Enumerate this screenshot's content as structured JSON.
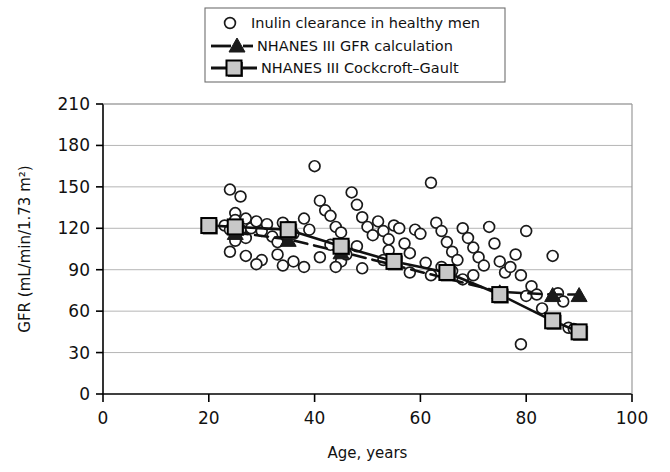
{
  "chart_data": {
    "type": "scatter",
    "title": "",
    "xlabel": "Age, years",
    "ylabel": "GFR  (mL/min/1.73 m²)",
    "xlim": [
      0,
      100
    ],
    "ylim": [
      0,
      210
    ],
    "xticks": [
      0,
      20,
      40,
      60,
      80,
      100
    ],
    "yticks": [
      0,
      30,
      60,
      90,
      120,
      150,
      180,
      210
    ],
    "grid": "horizontal",
    "legend_position": "top-center",
    "legend": [
      {
        "label": "Inulin clearance in healthy men",
        "marker": "open-circle",
        "line": "none"
      },
      {
        "label": "NHANES III GFR calculation",
        "marker": "filled-triangle",
        "line": "dashed"
      },
      {
        "label": "NHANES III Cockcroft–Gault",
        "marker": "filled-square",
        "line": "solid"
      }
    ],
    "series": [
      {
        "name": "Inulin clearance in healthy men",
        "marker": "open-circle",
        "points": [
          [
            24,
            148
          ],
          [
            26,
            143
          ],
          [
            25,
            131
          ],
          [
            25,
            126
          ],
          [
            27,
            127
          ],
          [
            23,
            122
          ],
          [
            24,
            119
          ],
          [
            26,
            119
          ],
          [
            28,
            120
          ],
          [
            29,
            125
          ],
          [
            27,
            113
          ],
          [
            25,
            111
          ],
          [
            24,
            103
          ],
          [
            27,
            100
          ],
          [
            30,
            118
          ],
          [
            31,
            123
          ],
          [
            32,
            114
          ],
          [
            33,
            110
          ],
          [
            34,
            124
          ],
          [
            35,
            121
          ],
          [
            36,
            116
          ],
          [
            33,
            101
          ],
          [
            30,
            97
          ],
          [
            36,
            96
          ],
          [
            38,
            127
          ],
          [
            39,
            119
          ],
          [
            40,
            165
          ],
          [
            41,
            140
          ],
          [
            42,
            133
          ],
          [
            43,
            129
          ],
          [
            44,
            121
          ],
          [
            45,
            117
          ],
          [
            43,
            108
          ],
          [
            41,
            99
          ],
          [
            45,
            96
          ],
          [
            47,
            146
          ],
          [
            48,
            137
          ],
          [
            49,
            128
          ],
          [
            50,
            121
          ],
          [
            51,
            115
          ],
          [
            48,
            107
          ],
          [
            46,
            101
          ],
          [
            52,
            125
          ],
          [
            53,
            118
          ],
          [
            54,
            112
          ],
          [
            55,
            122
          ],
          [
            56,
            120
          ],
          [
            54,
            104
          ],
          [
            53,
            97
          ],
          [
            57,
            109
          ],
          [
            58,
            102
          ],
          [
            59,
            119
          ],
          [
            60,
            116
          ],
          [
            61,
            95
          ],
          [
            62,
            153
          ],
          [
            63,
            124
          ],
          [
            64,
            118
          ],
          [
            65,
            110
          ],
          [
            66,
            103
          ],
          [
            67,
            97
          ],
          [
            64,
            92
          ],
          [
            66,
            89
          ],
          [
            68,
            120
          ],
          [
            69,
            113
          ],
          [
            70,
            106
          ],
          [
            71,
            99
          ],
          [
            72,
            93
          ],
          [
            70,
            86
          ],
          [
            68,
            83
          ],
          [
            73,
            121
          ],
          [
            74,
            109
          ],
          [
            75,
            96
          ],
          [
            76,
            88
          ],
          [
            77,
            92
          ],
          [
            78,
            101
          ],
          [
            79,
            86
          ],
          [
            80,
            118
          ],
          [
            81,
            78
          ],
          [
            80,
            71
          ],
          [
            82,
            72
          ],
          [
            83,
            62
          ],
          [
            79,
            36
          ],
          [
            85,
            100
          ],
          [
            86,
            73
          ],
          [
            87,
            67
          ],
          [
            88,
            48
          ],
          [
            89,
            47
          ],
          [
            58,
            88
          ],
          [
            62,
            86
          ],
          [
            44,
            92
          ],
          [
            38,
            92
          ],
          [
            29,
            94
          ],
          [
            34,
            93
          ],
          [
            49,
            91
          ]
        ]
      },
      {
        "name": "NHANES III GFR calculation",
        "marker": "filled-triangle",
        "line": "dashed",
        "points": [
          [
            25,
            117
          ],
          [
            35,
            112
          ],
          [
            45,
            103
          ],
          [
            75,
            74
          ],
          [
            85,
            72
          ],
          [
            90,
            72
          ]
        ]
      },
      {
        "name": "NHANES III Cockcroft–Gault",
        "marker": "filled-square",
        "line": "solid",
        "points": [
          [
            20,
            122
          ],
          [
            25,
            121
          ],
          [
            35,
            119
          ],
          [
            45,
            107
          ],
          [
            55,
            96
          ],
          [
            65,
            88
          ],
          [
            75,
            72
          ],
          [
            85,
            53
          ],
          [
            90,
            45
          ]
        ]
      }
    ]
  },
  "colors": {
    "axis": "#000000",
    "grid": "#b5b5b5",
    "marker_fill": "#c8c8c8",
    "marker_edge": "#000000",
    "triangle_fill": "#1a1a1a",
    "circle_edge": "#1a1a1a",
    "line": "#111111"
  }
}
